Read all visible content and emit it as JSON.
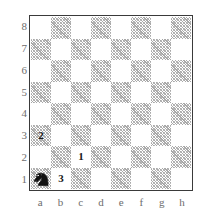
{
  "diagram": {
    "kind": "chessboard-diagram",
    "orientation": "white-bottom",
    "files": [
      "a",
      "b",
      "c",
      "d",
      "e",
      "f",
      "g",
      "h"
    ],
    "ranks": [
      "8",
      "7",
      "6",
      "5",
      "4",
      "3",
      "2",
      "1"
    ],
    "colors": {
      "light_square": "#ffffff",
      "dark_square_hatch": "#a8a8a8",
      "border": "#3a3a3a",
      "label_text": "#6d6d6d",
      "marker_text": "#1a1a1a",
      "piece_black": "#111111",
      "background": "#ffffff"
    },
    "pieces": [
      {
        "square": "a1",
        "piece": "knight",
        "color": "black",
        "glyph": "black-knight-icon"
      }
    ],
    "markers": [
      {
        "square": "c2",
        "label": "1"
      },
      {
        "square": "a3",
        "label": "2"
      },
      {
        "square": "b1",
        "label": "3"
      }
    ]
  }
}
